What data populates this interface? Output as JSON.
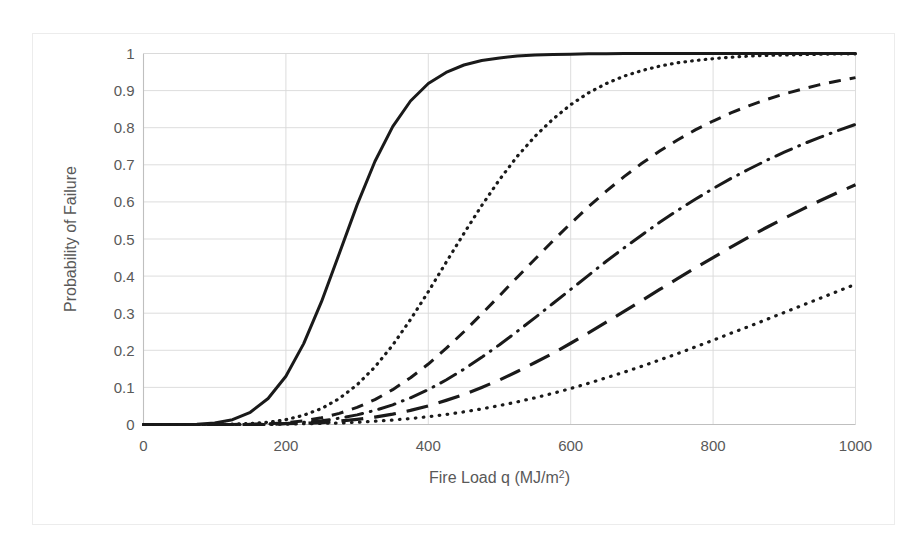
{
  "figure": {
    "name": "probability-of-failure-vs-fire-load",
    "background_color": "#ffffff",
    "frame_color": "#ececec",
    "gridline_color": "#d9d9d9",
    "axis_color": "#bfbfbf",
    "text_color": "#595959",
    "curve_color": "#1a1a1a"
  },
  "axes": {
    "x_title": "Fire Load q (MJ/m",
    "x_title_sup": "2",
    "x_title_close": ")",
    "x_title_full": "Fire Load q (MJ/m2)",
    "y_title": "Probability of Failure",
    "x_ticks": [
      "0",
      "200",
      "400",
      "600",
      "800",
      "1000"
    ],
    "y_ticks": [
      "0",
      "0.1",
      "0.2",
      "0.3",
      "0.4",
      "0.5",
      "0.6",
      "0.7",
      "0.8",
      "0.9",
      "1"
    ]
  },
  "chart_data": {
    "type": "line",
    "title": "",
    "subtitle": "",
    "xlabel": "Fire Load q (MJ/m2)",
    "ylabel": "Probability of Failure",
    "xlim": [
      0,
      1000
    ],
    "ylim": [
      0,
      1
    ],
    "xticks": [
      0,
      200,
      400,
      600,
      800,
      1000
    ],
    "yticks": [
      0,
      0.1,
      0.2,
      0.3,
      0.4,
      0.5,
      0.6,
      0.7,
      0.8,
      0.9,
      1
    ],
    "grid": "horizontal-and-vertical",
    "legend": "none",
    "x": [
      0,
      25,
      50,
      75,
      100,
      125,
      150,
      175,
      200,
      225,
      250,
      275,
      300,
      325,
      350,
      375,
      400,
      425,
      450,
      475,
      500,
      525,
      550,
      575,
      600,
      625,
      650,
      675,
      700,
      725,
      750,
      775,
      800,
      825,
      850,
      875,
      900,
      925,
      950,
      975,
      1000
    ],
    "series": [
      {
        "name": "curve-1-solid",
        "style": "solid",
        "values": [
          0.0,
          0.0,
          0.0,
          0.001,
          0.004,
          0.013,
          0.033,
          0.07,
          0.13,
          0.218,
          0.331,
          0.461,
          0.592,
          0.709,
          0.803,
          0.872,
          0.919,
          0.949,
          0.969,
          0.981,
          0.988,
          0.993,
          0.996,
          0.997,
          0.998,
          0.999,
          0.999,
          1.0,
          1.0,
          1.0,
          1.0,
          1.0,
          1.0,
          1.0,
          1.0,
          1.0,
          1.0,
          1.0,
          1.0,
          1.0,
          1.0
        ]
      },
      {
        "name": "curve-2-fine-dotted",
        "style": "dotted-fine",
        "values": [
          0.0,
          0.0,
          0.0,
          0.0,
          0.0,
          0.001,
          0.003,
          0.006,
          0.013,
          0.025,
          0.043,
          0.07,
          0.107,
          0.155,
          0.214,
          0.283,
          0.358,
          0.437,
          0.515,
          0.59,
          0.66,
          0.723,
          0.777,
          0.823,
          0.862,
          0.894,
          0.919,
          0.939,
          0.954,
          0.966,
          0.975,
          0.981,
          0.986,
          0.99,
          0.993,
          0.995,
          0.996,
          0.997,
          0.998,
          0.999,
          0.999
        ]
      },
      {
        "name": "curve-3-medium-dashed",
        "style": "dashed-medium",
        "values": [
          0.0,
          0.0,
          0.0,
          0.0,
          0.0,
          0.0,
          0.001,
          0.002,
          0.005,
          0.01,
          0.018,
          0.03,
          0.046,
          0.067,
          0.094,
          0.126,
          0.163,
          0.205,
          0.25,
          0.298,
          0.347,
          0.397,
          0.446,
          0.495,
          0.542,
          0.587,
          0.629,
          0.668,
          0.704,
          0.737,
          0.767,
          0.794,
          0.818,
          0.84,
          0.859,
          0.876,
          0.891,
          0.904,
          0.916,
          0.926,
          0.935
        ]
      },
      {
        "name": "curve-4-dash-dot",
        "style": "dash-dot",
        "values": [
          0.0,
          0.0,
          0.0,
          0.0,
          0.0,
          0.0,
          0.0,
          0.001,
          0.003,
          0.006,
          0.01,
          0.017,
          0.026,
          0.038,
          0.053,
          0.072,
          0.094,
          0.12,
          0.149,
          0.181,
          0.215,
          0.251,
          0.288,
          0.326,
          0.364,
          0.402,
          0.44,
          0.476,
          0.511,
          0.545,
          0.577,
          0.607,
          0.636,
          0.663,
          0.688,
          0.712,
          0.734,
          0.755,
          0.774,
          0.792,
          0.809
        ]
      },
      {
        "name": "curve-5-long-dash",
        "style": "dashed-long",
        "values": [
          0.0,
          0.0,
          0.0,
          0.0,
          0.0,
          0.0,
          0.0,
          0.0,
          0.002,
          0.003,
          0.005,
          0.009,
          0.014,
          0.02,
          0.028,
          0.038,
          0.05,
          0.065,
          0.081,
          0.1,
          0.12,
          0.143,
          0.167,
          0.192,
          0.219,
          0.247,
          0.276,
          0.305,
          0.334,
          0.364,
          0.393,
          0.422,
          0.45,
          0.478,
          0.505,
          0.531,
          0.556,
          0.58,
          0.603,
          0.625,
          0.646
        ]
      },
      {
        "name": "curve-6-sparse-dotted",
        "style": "dotted-sparse",
        "values": [
          0.0,
          0.0,
          0.0,
          0.0,
          0.0,
          0.0,
          0.0,
          0.0,
          0.001,
          0.002,
          0.003,
          0.004,
          0.006,
          0.009,
          0.012,
          0.016,
          0.021,
          0.027,
          0.034,
          0.042,
          0.051,
          0.061,
          0.072,
          0.084,
          0.097,
          0.111,
          0.126,
          0.141,
          0.157,
          0.174,
          0.191,
          0.209,
          0.227,
          0.246,
          0.264,
          0.283,
          0.302,
          0.321,
          0.34,
          0.359,
          0.378
        ]
      }
    ]
  }
}
